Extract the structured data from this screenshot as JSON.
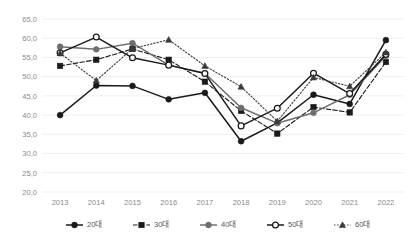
{
  "chart_data": {
    "type": "line",
    "title": "",
    "xlabel": "",
    "ylabel": "",
    "ylim": [
      20.0,
      65.0
    ],
    "ytick_step": 5.0,
    "grid": true,
    "legend_position": "bottom",
    "decimal_separator": ",",
    "categories": [
      "2013",
      "2014",
      "2015",
      "2016",
      "2017",
      "2018",
      "2019",
      "2020",
      "2021",
      "2022"
    ],
    "ytick_labels": [
      "20,0",
      "25,0",
      "30,0",
      "35,0",
      "40,0",
      "45,0",
      "50,0",
      "55,0",
      "60,0",
      "65,0"
    ],
    "series": [
      {
        "name": "20대",
        "marker": "filled-circle",
        "line_style": "solid",
        "color": "#1a1a1a",
        "values": [
          40.0,
          47.7,
          47.6,
          44.1,
          45.8,
          33.2,
          38.0,
          45.3,
          42.9,
          59.5
        ]
      },
      {
        "name": "30대",
        "marker": "filled-square",
        "line_style": "dashed",
        "color": "#1a1a1a",
        "values": [
          52.8,
          54.4,
          57.2,
          54.4,
          48.7,
          41.1,
          35.2,
          42.1,
          40.7,
          53.8
        ]
      },
      {
        "name": "40대",
        "marker": "filled-circle",
        "line_style": "solid",
        "color": "#6e6e6e",
        "values": [
          57.8,
          57.1,
          58.7,
          53.0,
          50.9,
          41.9,
          37.9,
          40.6,
          45.3,
          55.4
        ]
      },
      {
        "name": "50대",
        "marker": "open-circle",
        "line_style": "solid",
        "color": "#1a1a1a",
        "values": [
          56.2,
          60.3,
          54.9,
          53.0,
          50.8,
          37.2,
          41.8,
          50.9,
          45.6,
          55.8
        ]
      },
      {
        "name": "60대",
        "marker": "filled-triangle",
        "line_style": "dotted",
        "color": "#3a3a3a",
        "values": [
          56.1,
          49.0,
          57.3,
          59.6,
          52.8,
          47.4,
          38.4,
          49.8,
          47.5,
          56.3
        ]
      }
    ]
  },
  "legend": {
    "items": [
      {
        "label": "20대"
      },
      {
        "label": "30대"
      },
      {
        "label": "40대"
      },
      {
        "label": "50대"
      },
      {
        "label": "60대"
      }
    ]
  },
  "axis": {
    "x_axis_name": "year-axis",
    "y_axis_name": "value-axis"
  }
}
